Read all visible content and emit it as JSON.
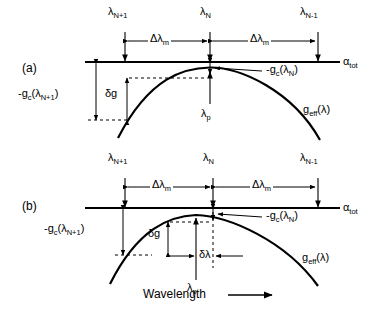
{
  "figure": {
    "type": "scientific-diagram",
    "background_color": "#ffffff",
    "line_color": "#000000"
  },
  "panels": [
    {
      "id": "a",
      "label": "(a)",
      "loss_line_label": "α",
      "loss_line_sub": "tot",
      "gain_curve_label_base": "g",
      "gain_curve_label_sub": "eff",
      "gain_curve_label_arg": "(λ)",
      "modes": [
        {
          "name": "mode-n-plus-1",
          "base": "λ",
          "sub": "N+1"
        },
        {
          "name": "mode-n",
          "base": "λ",
          "sub": "N"
        },
        {
          "name": "mode-n-minus-1",
          "base": "λ",
          "sub": "N-1"
        }
      ],
      "spacings": [
        {
          "name": "mode-spacing-left",
          "base": "Δλ",
          "sub": "m"
        },
        {
          "name": "mode-spacing-right",
          "base": "Δλ",
          "sub": "m"
        }
      ],
      "annotations": [
        {
          "name": "gain-margin-mode-n",
          "text": "-g",
          "sub": "c",
          "arg": "(λ",
          "sub2": "N",
          "tail": ")"
        },
        {
          "name": "gain-margin-mode-n-plus-1",
          "text": "-g",
          "sub": "c",
          "arg": "(λ",
          "sub2": "N+1",
          "tail": ")"
        },
        {
          "name": "gain-difference",
          "text": "δg"
        },
        {
          "name": "peak-wavelength",
          "base": "λ",
          "sub": "p"
        }
      ]
    },
    {
      "id": "b",
      "label": "(b)",
      "loss_line_label": "α",
      "loss_line_sub": "tot",
      "gain_curve_label_base": "g",
      "gain_curve_label_sub": "eff",
      "gain_curve_label_arg": "(λ)",
      "modes": [
        {
          "name": "mode-n-plus-1",
          "base": "λ",
          "sub": "N+1"
        },
        {
          "name": "mode-n",
          "base": "λ",
          "sub": "N"
        },
        {
          "name": "mode-n-minus-1",
          "base": "λ",
          "sub": "N-1"
        }
      ],
      "spacings": [
        {
          "name": "mode-spacing-left",
          "base": "Δλ",
          "sub": "m"
        },
        {
          "name": "mode-spacing-right",
          "base": "Δλ",
          "sub": "m"
        }
      ],
      "annotations": [
        {
          "name": "gain-margin-mode-n",
          "text": "-g",
          "sub": "c",
          "arg": "(λ",
          "sub2": "N",
          "tail": ")"
        },
        {
          "name": "gain-margin-mode-n-plus-1",
          "text": "-g",
          "sub": "c",
          "arg": "(λ",
          "sub2": "N+1",
          "tail": ")"
        },
        {
          "name": "gain-difference",
          "text": "δg"
        },
        {
          "name": "peak-detuning",
          "text": "δλ"
        },
        {
          "name": "peak-wavelength",
          "base": "λ",
          "sub": "p"
        }
      ]
    }
  ],
  "axis": {
    "x_label": "Wavelength",
    "x_arrow": "⟶"
  }
}
